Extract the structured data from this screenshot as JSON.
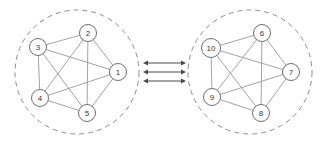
{
  "diagram": {
    "type": "graph-cluster-pair",
    "background_color": "#ffffff",
    "title": "",
    "clusters": [
      {
        "id": "left-cluster",
        "name": "cluster-left",
        "boundary": {
          "shape": "circle",
          "cx": 77,
          "cy": 72,
          "r": 62,
          "style": "dashed",
          "color": "#8c8c8c"
        },
        "complete_graph": true,
        "nodes": [
          {
            "label": "1",
            "cx": 118,
            "cy": 72,
            "r": 8.5
          },
          {
            "label": "2",
            "cx": 88,
            "cy": 33,
            "r": 8.5
          },
          {
            "label": "3",
            "cx": 38,
            "cy": 47,
            "r": 8.5
          },
          {
            "label": "4",
            "cx": 40,
            "cy": 98,
            "r": 8.5
          },
          {
            "label": "5",
            "cx": 87,
            "cy": 113,
            "r": 8.5
          }
        ],
        "edges": [
          [
            "1",
            "2"
          ],
          [
            "1",
            "3"
          ],
          [
            "1",
            "4"
          ],
          [
            "1",
            "5"
          ],
          [
            "2",
            "3"
          ],
          [
            "2",
            "4"
          ],
          [
            "2",
            "5"
          ],
          [
            "3",
            "4"
          ],
          [
            "3",
            "5"
          ],
          [
            "4",
            "5"
          ]
        ]
      },
      {
        "id": "right-cluster",
        "name": "cluster-right",
        "boundary": {
          "shape": "circle",
          "cx": 250,
          "cy": 72,
          "r": 62,
          "style": "dashed",
          "color": "#8c8c8c"
        },
        "complete_graph": true,
        "nodes": [
          {
            "label": "6",
            "cx": 262,
            "cy": 33,
            "r": 8.5
          },
          {
            "label": "7",
            "cx": 291,
            "cy": 72,
            "r": 8.5
          },
          {
            "label": "8",
            "cx": 261,
            "cy": 113,
            "r": 8.5
          },
          {
            "label": "9",
            "cx": 212,
            "cy": 97,
            "r": 8.5
          },
          {
            "label": "10",
            "cx": 211,
            "cy": 48,
            "r": 9.5
          }
        ],
        "edges": [
          [
            "6",
            "7"
          ],
          [
            "6",
            "8"
          ],
          [
            "6",
            "9"
          ],
          [
            "6",
            "10"
          ],
          [
            "7",
            "8"
          ],
          [
            "7",
            "9"
          ],
          [
            "7",
            "10"
          ],
          [
            "8",
            "9"
          ],
          [
            "8",
            "10"
          ],
          [
            "9",
            "10"
          ]
        ]
      }
    ],
    "connectors": {
      "name": "inter-cluster-links",
      "count": 3,
      "direction": "bidirectional",
      "color": "#4a4a4a",
      "x_start": 143,
      "x_end": 186,
      "y_values": [
        63,
        72,
        81
      ]
    }
  }
}
